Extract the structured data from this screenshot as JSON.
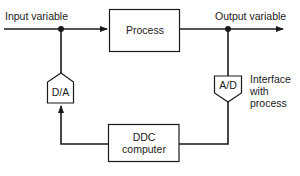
{
  "diagram": {
    "type": "block-diagram",
    "colors": {
      "line": "#1a1a1a",
      "background": "#ffffff"
    },
    "labels": {
      "input_variable": "Input variable",
      "output_variable": "Output variable",
      "interface_line1": "Interface",
      "interface_line2": "with",
      "interface_line3": "process"
    },
    "blocks": {
      "process": "Process",
      "ddc_line1": "DDC",
      "ddc_line2": "computer",
      "da_converter": "D/A",
      "ad_converter": "A/D"
    },
    "connections": [
      {
        "from": "Input variable",
        "to": "Process"
      },
      {
        "from": "Process",
        "to": "Output variable"
      },
      {
        "from": "Output variable",
        "to": "A/D"
      },
      {
        "from": "A/D",
        "to": "DDC computer"
      },
      {
        "from": "DDC computer",
        "to": "D/A"
      },
      {
        "from": "D/A",
        "to": "Input variable"
      }
    ]
  }
}
